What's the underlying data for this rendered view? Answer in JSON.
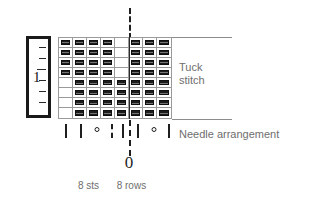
{
  "diagram": {
    "gauge_swatch": {
      "name": "gauge-ruler",
      "label": "1",
      "tick_count": 7
    },
    "chart": {
      "columns": 8,
      "rows": 8,
      "stitch_counts": {
        "stitches_label": "8 sts",
        "rows_label": "8 rows"
      },
      "centre_marker_label": "0",
      "legend_tuck": "Tuck\nstitch",
      "legend_tuck_line1": "Tuck",
      "legend_tuck_line2": "stitch",
      "legend_needles": "Needle arrangement"
    },
    "needle_arrangement": {
      "symbols": [
        {
          "type": "bar",
          "glyph": "|"
        },
        {
          "type": "bar",
          "glyph": "|"
        },
        {
          "type": "circle",
          "glyph": "°"
        },
        {
          "type": "dashed",
          "glyph": "¦"
        },
        {
          "type": "bar",
          "glyph": "|"
        },
        {
          "type": "bar",
          "glyph": "|"
        },
        {
          "type": "circle",
          "glyph": "°"
        },
        {
          "type": "bar",
          "glyph": "|"
        }
      ]
    },
    "colors": {
      "ink": "#1f1f1f",
      "grid": "#9a9a9a",
      "text": "#6e6e6e",
      "tuck_fill": "#1c1c1c"
    }
  },
  "chart_data": {
    "type": "heatmap",
    "xlabel": "8 sts",
    "ylabel": "8 rows",
    "categories": [
      "1",
      "2",
      "3",
      "4",
      "5",
      "6",
      "7",
      "8"
    ],
    "row_labels": [
      "1",
      "2",
      "3",
      "4",
      "5",
      "6",
      "7",
      "8"
    ],
    "legend": [
      "tuck stitch",
      "plain"
    ],
    "grid": true,
    "note": "1 = tuck stitch symbol present, 0 = empty cell. Rows listed top to bottom.",
    "values": [
      [
        1,
        1,
        1,
        1,
        0,
        1,
        1,
        1
      ],
      [
        1,
        1,
        1,
        1,
        0,
        1,
        1,
        1
      ],
      [
        1,
        1,
        1,
        1,
        0,
        1,
        1,
        1
      ],
      [
        1,
        1,
        1,
        1,
        0,
        1,
        1,
        1
      ],
      [
        0,
        1,
        1,
        1,
        1,
        1,
        1,
        1
      ],
      [
        0,
        1,
        1,
        1,
        1,
        1,
        1,
        1
      ],
      [
        0,
        1,
        1,
        1,
        1,
        1,
        1,
        1
      ],
      [
        0,
        1,
        1,
        1,
        1,
        1,
        1,
        1
      ]
    ]
  }
}
